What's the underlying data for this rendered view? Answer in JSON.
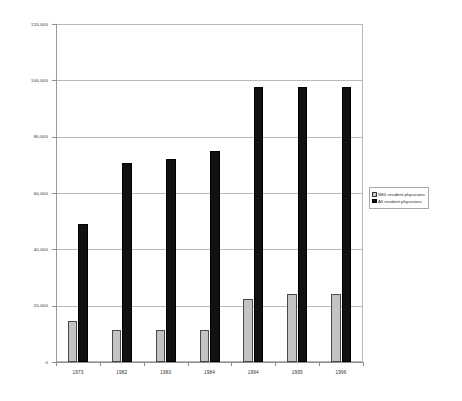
{
  "chart_data": {
    "type": "bar",
    "title": "",
    "xlabel": "",
    "ylabel": "",
    "categories": [
      "1973",
      "1982",
      "1983",
      "1984",
      "1994",
      "1995",
      "1996"
    ],
    "series": [
      {
        "name": "IMG resident physicians",
        "color": "#c3c3c3",
        "values": [
          14500,
          11500,
          11500,
          11500,
          22500,
          24000,
          24000
        ]
      },
      {
        "name": "All resident physicians",
        "color": "#111111",
        "values": [
          49000,
          70500,
          72000,
          75000,
          97500,
          97500,
          97500
        ]
      }
    ],
    "ylim": [
      0,
      120000
    ],
    "ytick_values": [
      0,
      20000,
      40000,
      60000,
      80000,
      100000,
      120000
    ],
    "ytick_labels": [
      "0",
      "20,000",
      "40,000",
      "60,000",
      "80,000",
      "100,000",
      "120,000"
    ],
    "grid": true,
    "legend_position": "right"
  },
  "legend": {
    "entries": [
      {
        "label": "IMG resident physicians",
        "swatch": "gray-swatch"
      },
      {
        "label": "All resident physicians",
        "swatch": "black-swatch"
      }
    ]
  }
}
